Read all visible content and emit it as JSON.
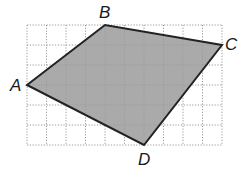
{
  "diagram": {
    "type": "quadrilateral-on-grid",
    "grid": {
      "columns": 10,
      "rows": 6,
      "origin_px": [
        27,
        145
      ],
      "cell_w_px": 19.5,
      "cell_h_px": 20,
      "line_color": "#9a9a9a",
      "line_style": "dotted"
    },
    "shape": {
      "fill_color": "#9b9b9b",
      "stroke_color": "#222222",
      "vertices": [
        {
          "label": "A",
          "grid": [
            0,
            3
          ]
        },
        {
          "label": "B",
          "grid": [
            4,
            6
          ]
        },
        {
          "label": "C",
          "grid": [
            10,
            5
          ]
        },
        {
          "label": "D",
          "grid": [
            6,
            0
          ]
        }
      ]
    },
    "labels": {
      "A": "A",
      "B": "B",
      "C": "C",
      "D": "D"
    }
  }
}
